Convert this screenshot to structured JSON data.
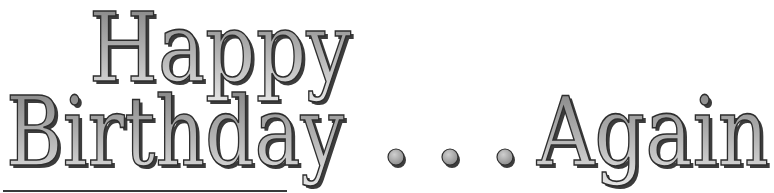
{
  "title": {
    "line1": "Happy",
    "line2_word": "Birthday",
    "ellipsis": ". . .",
    "line2_end": "Again"
  },
  "colors": {
    "fill_top": "#7c7c7c",
    "fill_mid": "#a9a9a9",
    "fill_bottom": "#e6e6e6",
    "outline": "#2e2e2e",
    "shadow": "#3c3c3c",
    "rule": "#3a3a3a",
    "background": "#ffffff"
  }
}
